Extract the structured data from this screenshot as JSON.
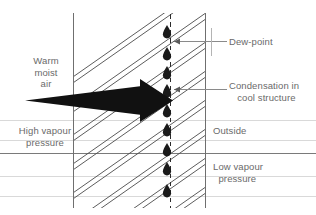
{
  "figure": {
    "type": "technical-diagram",
    "background_color": "#ffffff",
    "width": 316,
    "height": 215
  },
  "labels": {
    "warm_moist_air": "Warm\nmoist\nair",
    "high_vapour_pressure": "High vapour\npressure",
    "outside": "Outside",
    "low_vapour_pressure": "Low vapour\n  pressure",
    "dew_point": "Dew-point",
    "condensation": "Condensation in\n   cool structure"
  },
  "colors": {
    "text": "#6a6a6a",
    "wall_outline": "#6f6f6f",
    "hatch_line": "#4a4a4a",
    "gridline_light": "#d9d9d9",
    "gridline_dark": "#7a7a7a",
    "droplet": "#1a1a1a",
    "arrow": "#111111",
    "dashed_line": "#2b2b2b",
    "leader_line": "#8a8a8a"
  },
  "elements": {
    "wall": {
      "name": "wall-section",
      "left_face_x": 73,
      "right_face_x": 205,
      "top_y": 13,
      "bottom_y": 208
    },
    "dew_point_line": {
      "name": "dew-point-dashed-line",
      "x": 170,
      "top_y": 14,
      "bottom_y": 208,
      "style": "dashed"
    },
    "vapour_arrow": {
      "name": "vapour-flow-arrow",
      "direction": "left-to-right",
      "tail_x": 25,
      "tip_x": 173,
      "axis_y": 100
    },
    "droplets": {
      "name": "condensation-droplets",
      "count": 9,
      "x": 167,
      "y_positions": [
        31,
        53,
        72,
        90,
        110,
        129,
        149,
        168,
        190
      ]
    },
    "hatching": {
      "name": "wall-hatching",
      "pattern": "diagonal double lines",
      "angle_deg": 35,
      "pairs": 7
    }
  },
  "gridlines": {
    "light_y": [
      120,
      140,
      176,
      196
    ],
    "dark_y": [
      153
    ]
  },
  "leaders": [
    {
      "name": "dew-point-leader",
      "from_x": 227,
      "to_x": 174,
      "y": 41,
      "arrowhead": "left"
    },
    {
      "name": "condensation-leader",
      "from_x": 227,
      "to_x": 174,
      "y": 89,
      "arrowhead": "left"
    }
  ]
}
